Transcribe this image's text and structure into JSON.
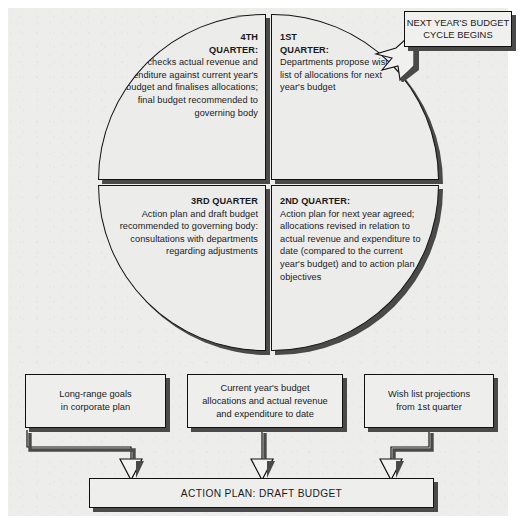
{
  "diagram": {
    "colors": {
      "page_background": "#ffffff",
      "panel_background": "#ededec",
      "shape_fill": "#ececeb",
      "outline": "#111111",
      "shadow": "#4a4a4a",
      "text": "#1a1a1a"
    }
  },
  "quarters": [
    {
      "id": "q4",
      "heading_line1": "4TH",
      "heading_line2": "QUARTER:",
      "body": "Director checks actual revenue and expenditure against current year's budget and finalises allocations; final budget recommended to governing body"
    },
    {
      "id": "q1",
      "heading_line1": "1ST",
      "heading_line2": "QUARTER:",
      "body": "Departments propose wish list of allocations for next year's budget"
    },
    {
      "id": "q3",
      "heading_line1": "3RD QUARTER",
      "heading_line2": "",
      "body": "Action plan and draft budget recommended to governing body: consultations with departments regarding adjustments"
    },
    {
      "id": "q2",
      "heading_line1": "2ND QUARTER:",
      "heading_line2": "",
      "body": "Action plan for next year agreed; allocations revised in relation to actual revenue and expenditure to date (compared to the current year's budget) and to action plan objectives"
    }
  ],
  "callout": {
    "line1": "NEXT YEAR'S BUDGET",
    "line2": "CYCLE BEGINS"
  },
  "source_boxes": [
    {
      "id": "box-long-range-goals",
      "line1": "Long-range goals",
      "line2": "in corporate plan",
      "line3": ""
    },
    {
      "id": "box-current-year-budget",
      "line1": "Current year's budget",
      "line2": "allocations and actual revenue",
      "line3": "and expenditure to date"
    },
    {
      "id": "box-wish-list",
      "line1": "Wish list projections",
      "line2": "from 1st quarter",
      "line3": ""
    }
  ],
  "action_bar": {
    "label": "ACTION PLAN: DRAFT BUDGET"
  }
}
